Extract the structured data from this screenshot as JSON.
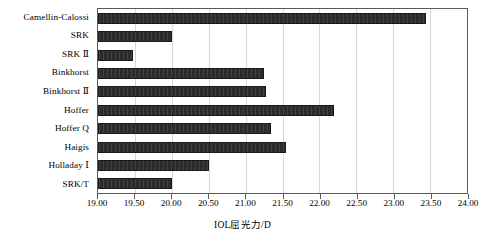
{
  "chart_data": {
    "type": "bar",
    "orientation": "horizontal",
    "title": "",
    "xlabel": "IOL屈光力/D",
    "ylabel": "",
    "xlim": [
      19.0,
      24.0
    ],
    "xticks": [
      "19.00",
      "19.50",
      "20.00",
      "20.50",
      "21.00",
      "21.50",
      "22.00",
      "22.50",
      "23.00",
      "23.50",
      "24.00"
    ],
    "xtick_values": [
      19.0,
      19.5,
      20.0,
      20.5,
      21.0,
      21.5,
      22.0,
      22.5,
      23.0,
      23.5,
      24.0
    ],
    "grid": true,
    "legend": "none",
    "bar_color": "#2b2b2b",
    "categories": [
      "Camellin-Calossi",
      "SRK",
      "SRK Ⅱ",
      "Binkhorst",
      "Binkhorst Ⅱ",
      "Hoffer",
      "Hoffer Q",
      "Haigis",
      "Holladay Ⅰ",
      "SRK/T"
    ],
    "values": [
      23.45,
      20.0,
      19.47,
      21.25,
      21.27,
      22.2,
      21.35,
      21.55,
      20.5,
      20.0
    ]
  }
}
